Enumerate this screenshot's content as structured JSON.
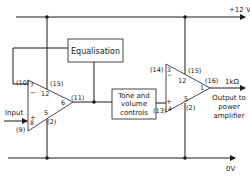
{
  "rails": {
    "positive": "+12 V",
    "ground": "0V"
  },
  "blocks": {
    "equalisation": "Equalisation",
    "tone_line1": "Tone and",
    "tone_line2": "volume",
    "tone_line3": "controls"
  },
  "input": {
    "label": "Input",
    "pin": "(9)"
  },
  "output": {
    "impedance": "1kΩ",
    "line1": "Output to",
    "line2": "power",
    "line3": "amplifier"
  },
  "amp1": {
    "pin_inv_ext": "(10)",
    "pin_inv_int": "7",
    "pin_noninv_int": "8",
    "pin_vplus_ext": "(15)",
    "pin_vplus_int": "12",
    "pin_out_int": "6",
    "pin_out_ext": "(11)",
    "pin_gnd_int": "5",
    "pin_gnd_ext": "(2)",
    "sign_minus": "−",
    "sign_plus": "+"
  },
  "amp2": {
    "pin_inv_ext": "(14)",
    "pin_inv_int": "3",
    "pin_noninv_int": "4",
    "pin_noninv_ext": "(13)",
    "pin_vplus_ext": "(15)",
    "pin_vplus_int": "12",
    "pin_out_int": "1",
    "pin_out_ext": "(16)",
    "pin_gnd_int": "5",
    "pin_gnd_ext": "(2)",
    "sign_minus": "−",
    "sign_plus": "+"
  }
}
